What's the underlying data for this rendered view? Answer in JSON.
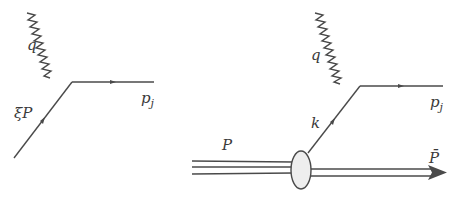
{
  "diagrams": [
    {
      "name": "partonic-process",
      "labels": {
        "photon": "q",
        "incoming": "ξP",
        "outgoing_main": "p",
        "outgoing_sub": "j"
      }
    },
    {
      "name": "hadronic-process",
      "labels": {
        "photon": "q",
        "parton": "k",
        "outgoing_main": "p",
        "outgoing_sub": "j",
        "hadron_in": "P",
        "remnant": "P̄"
      }
    }
  ],
  "colors": {
    "line": "#4a4a4a",
    "blob_fill": "#eeeeee",
    "text": "#3a3a3a"
  }
}
